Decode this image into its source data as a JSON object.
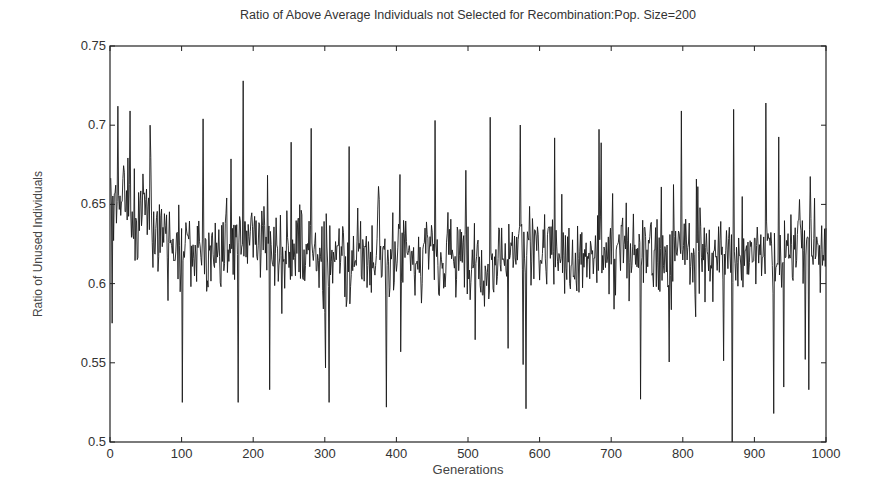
{
  "chart_data": {
    "type": "line",
    "title": "Ratio of Above Average Individuals not Selected for Recombination:Pop. Size=200",
    "xlabel": "Generations",
    "ylabel": "Ratio of Unused Individuals",
    "xlim": [
      0,
      1000
    ],
    "ylim": [
      0.5,
      0.75
    ],
    "xticks": [
      0,
      100,
      200,
      300,
      400,
      500,
      600,
      700,
      800,
      900,
      1000
    ],
    "xtick_labels": [
      "0",
      "100",
      "200",
      "300",
      "400",
      "500",
      "600",
      "700",
      "800",
      "900",
      "1000"
    ],
    "yticks": [
      0.5,
      0.55,
      0.6,
      0.65,
      0.7,
      0.75
    ],
    "ytick_labels": [
      "0.5",
      "0.55",
      "0.6",
      "0.65",
      "0.7",
      "0.75"
    ],
    "grid": false,
    "legend": null,
    "series": [
      {
        "name": "Ratio of Unused Individuals",
        "n_points": 1000,
        "mean": 0.62,
        "typical_range": [
          0.58,
          0.665
        ],
        "early_level_0_80": 0.64,
        "key_points": [
          {
            "x": 2,
            "y": 0.575
          },
          {
            "x": 10,
            "y": 0.712
          },
          {
            "x": 27,
            "y": 0.709
          },
          {
            "x": 55,
            "y": 0.7
          },
          {
            "x": 100,
            "y": 0.525
          },
          {
            "x": 129,
            "y": 0.704
          },
          {
            "x": 178,
            "y": 0.525
          },
          {
            "x": 185,
            "y": 0.728
          },
          {
            "x": 222,
            "y": 0.533
          },
          {
            "x": 280,
            "y": 0.698
          },
          {
            "x": 305,
            "y": 0.525
          },
          {
            "x": 385,
            "y": 0.522
          },
          {
            "x": 453,
            "y": 0.703
          },
          {
            "x": 530,
            "y": 0.705
          },
          {
            "x": 580,
            "y": 0.521
          },
          {
            "x": 620,
            "y": 0.692
          },
          {
            "x": 740,
            "y": 0.527
          },
          {
            "x": 797,
            "y": 0.709
          },
          {
            "x": 868,
            "y": 0.5
          },
          {
            "x": 870,
            "y": 0.71
          },
          {
            "x": 915,
            "y": 0.714
          },
          {
            "x": 926,
            "y": 0.518
          },
          {
            "x": 975,
            "y": 0.533
          }
        ]
      }
    ]
  }
}
